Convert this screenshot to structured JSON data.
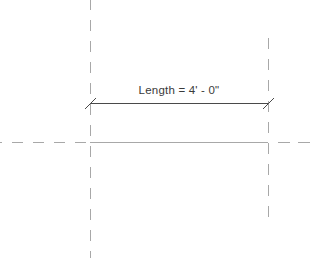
{
  "drawing": {
    "dimension": {
      "label": "Length = 4' - 0\"",
      "value": "4' - 0\"",
      "parameter": "Length"
    },
    "colors": {
      "background": "#ffffff",
      "reference_line": "#a8a8a8",
      "dimension_line": "#4a4a4a",
      "text": "#3a3a3a"
    },
    "reference_planes": [
      {
        "name": "left-vertical",
        "orientation": "vertical"
      },
      {
        "name": "right-vertical",
        "orientation": "vertical"
      },
      {
        "name": "horizontal",
        "orientation": "horizontal"
      }
    ]
  }
}
